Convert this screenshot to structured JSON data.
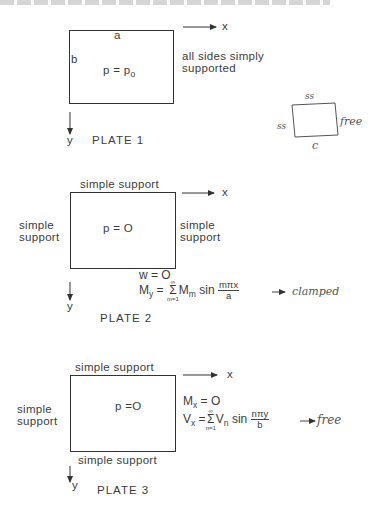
{
  "plates": [
    {
      "id": "plate-1",
      "title": "PLATE 1",
      "load": "p = p",
      "load_subscript": "o",
      "edge_top_label": "a",
      "edge_left_label": "b",
      "x_axis": "x",
      "y_axis": "y",
      "note_line1": "all sides simply",
      "note_line2": "supported"
    },
    {
      "id": "plate-2",
      "title": "PLATE 2",
      "load": "p = O",
      "top_support": "simple  support",
      "left_support": [
        "simple",
        "support"
      ],
      "right_support": [
        "simple",
        "support"
      ],
      "x_axis": "x",
      "y_axis": "y",
      "bc_line1": "w = O",
      "bc_line2": {
        "lhs": "M",
        "lhs_sub": "y",
        "eq": "=",
        "sum_top": "∞",
        "sum_bottom": "m=1",
        "term": "M",
        "term_sub": "m",
        "fn": "sin",
        "frac_num": "mπx",
        "frac_den": "a"
      },
      "annotation": "→ clamped"
    },
    {
      "id": "plate-3",
      "title": "PLATE 3",
      "load": "p =O",
      "top_support": "simple  support",
      "bottom_support": "simple  support",
      "left_support": [
        "simple",
        "support"
      ],
      "x_axis": "x",
      "y_axis": "y",
      "bc_line1": {
        "lhs": "M",
        "lhs_sub": "x",
        "rhs": "= O"
      },
      "bc_line2": {
        "lhs": "V",
        "lhs_sub": "x",
        "eq": "=",
        "sum_top": "∞",
        "sum_bottom": "n=1",
        "term": "V",
        "term_sub": "n",
        "fn": "sin",
        "frac_num": "nπy",
        "frac_den": "b"
      },
      "annotation": "→ free"
    }
  ],
  "sketch": {
    "top": "ss",
    "left": "ss",
    "right": "free",
    "bottom": "c"
  }
}
